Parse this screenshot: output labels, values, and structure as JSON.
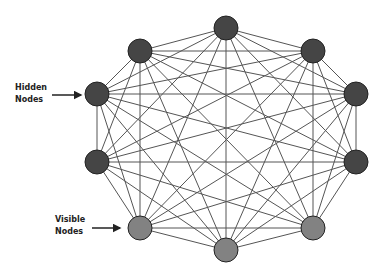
{
  "diagram": {
    "type": "complete-graph",
    "title": "",
    "edge_color": "#555555",
    "node_radius": 12,
    "nodes": [
      {
        "id": "n0",
        "x": 226,
        "y": 28,
        "type": "hidden",
        "color": "#454545"
      },
      {
        "id": "n1",
        "x": 313,
        "y": 51,
        "type": "hidden",
        "color": "#454545"
      },
      {
        "id": "n2",
        "x": 356,
        "y": 94,
        "type": "hidden",
        "color": "#454545"
      },
      {
        "id": "n3",
        "x": 356,
        "y": 162,
        "type": "hidden",
        "color": "#454545"
      },
      {
        "id": "n4",
        "x": 313,
        "y": 228,
        "type": "visible",
        "color": "#828282"
      },
      {
        "id": "n5",
        "x": 226,
        "y": 250,
        "type": "visible",
        "color": "#828282"
      },
      {
        "id": "n6",
        "x": 140,
        "y": 228,
        "type": "visible",
        "color": "#828282"
      },
      {
        "id": "n7",
        "x": 97,
        "y": 162,
        "type": "hidden",
        "color": "#454545"
      },
      {
        "id": "n8",
        "x": 97,
        "y": 94,
        "type": "hidden",
        "color": "#454545"
      },
      {
        "id": "n9",
        "x": 140,
        "y": 51,
        "type": "hidden",
        "color": "#454545"
      }
    ],
    "annotations": [
      {
        "id": "hidden-label",
        "line1": "Hidden",
        "line2": "Nodes",
        "text_x": 15,
        "text_y": 82,
        "arrow": {
          "x1": 52,
          "y1": 95,
          "x2": 81,
          "y2": 95
        }
      },
      {
        "id": "visible-label",
        "line1": "Visible",
        "line2": "Nodes",
        "text_x": 55,
        "text_y": 214,
        "arrow": {
          "x1": 92,
          "y1": 228,
          "x2": 120,
          "y2": 228
        }
      }
    ]
  }
}
